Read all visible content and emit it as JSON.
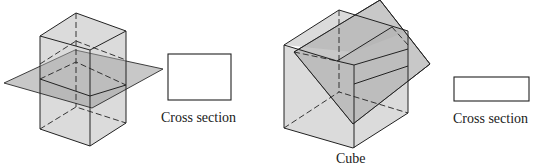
{
  "figures": [
    {
      "id": "prism-horizontal-plane",
      "solid": "Rectangular prism",
      "cut": "horizontal plane",
      "cross_section": {
        "shape": "rectangle",
        "label": "Cross section"
      }
    },
    {
      "id": "cube-oblique-plane",
      "solid": "Cube",
      "solid_label": "Cube",
      "cut": "oblique plane",
      "cross_section": {
        "shape": "rectangle",
        "label": "Cross section"
      }
    }
  ],
  "colors": {
    "solid_fill": "#b0b0b0",
    "plane_fill": "#9a9a9a",
    "line": "#222222",
    "background": "#ffffff"
  }
}
